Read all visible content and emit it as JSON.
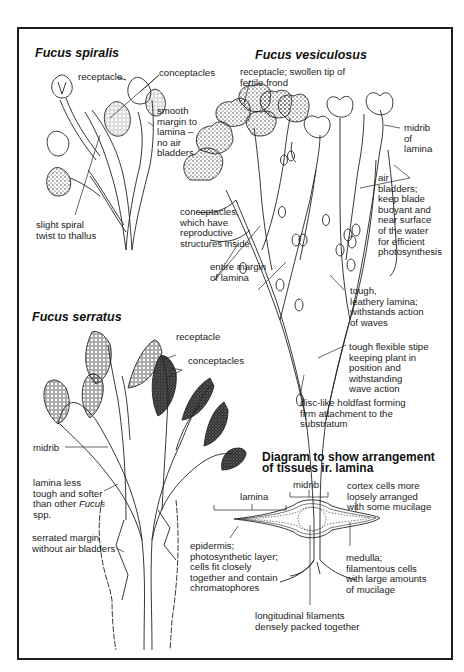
{
  "figure": {
    "colors": {
      "ink": "#1c1c1c",
      "paper": "#ffffff",
      "frame": "#1e1e1e"
    }
  },
  "spiralis": {
    "title": "Fucus spiralis",
    "labels": {
      "receptacle": "receptacle",
      "conceptacles": "conceptacles",
      "smooth_margin": "smooth\nmargin to\nlamina –\nno air\nbladders",
      "spiral_twist": "slight spiral\ntwist to thallus"
    }
  },
  "vesiculosus": {
    "title": "Fucus vesiculosus",
    "labels": {
      "receptacle": "receptacle; swollen tip of\nfertile frond",
      "midrib": "midrib\nof\nlamina",
      "air_bladders": "air\nbladders;\nkeep blade\nbuoyant and\nnear surface\nof the water\nfor efficient\nphotosynthesis",
      "conceptacles": "conceptacles,\nwhich have\nreproductive\nstructures inside",
      "entire_margin": "entire margin\nof lamina",
      "tough_lamina": "tough,\nleathery lamina;\nwithstands action\nof waves",
      "stipe": "tough flexible stipe\nkeeping plant in\nposition and\nwithstanding\nwave action",
      "holdfast": "disc-like holdfast forming\nfirm attachment to the\nsubstratum"
    }
  },
  "serratus": {
    "title": "Fucus serratus",
    "labels": {
      "receptacle": "receptacle",
      "conceptacles": "conceptacles",
      "midrib": "midrib",
      "lamina_less_tough_pre": "lamina less\ntough and softer\nthan other ",
      "lamina_less_tough_italic": "Fucus",
      "lamina_less_tough_post": "spp.",
      "serrated_margin": "serrated margin\nwithout air bladders"
    }
  },
  "lamina_section": {
    "title": "Diagram to show arrangement\nof tissues ir. lamina",
    "labels": {
      "lamina": "lamina",
      "midrib": "midrib",
      "cortex": "cortex cells more\nloosely arranged\nwith some mucilage",
      "epidermis": "epidermis;\nphotosynthetic layer;\ncells fit closely\ntogether and contain\nchromatophores",
      "medulla": "medulla;\nfilamentous cells\nwith large amounts\nof mucilage",
      "filaments": "longitudinal filaments\ndensely packed together"
    }
  }
}
